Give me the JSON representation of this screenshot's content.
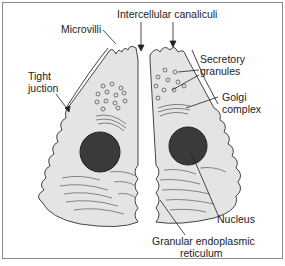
{
  "diagram": {
    "type": "labeled-illustration",
    "colors": {
      "cell_fill": "#e4e4e4",
      "outline": "#444444",
      "nucleus": "#3a3a3a",
      "frame": "#8a8a8a"
    },
    "labels": {
      "microvilli": "Microvilli",
      "intercellular_canaliculi": "Intercellular canaliculi",
      "tight_junction_1": "Tight",
      "tight_junction_2": "juction",
      "secretory_granules_1": "Secretory",
      "secretory_granules_2": "granules",
      "golgi_1": "Golgi",
      "golgi_2": "complex",
      "nucleus": "Nucleus",
      "rer_1": "Granular endoplasmic",
      "rer_2": "reticulum"
    }
  }
}
